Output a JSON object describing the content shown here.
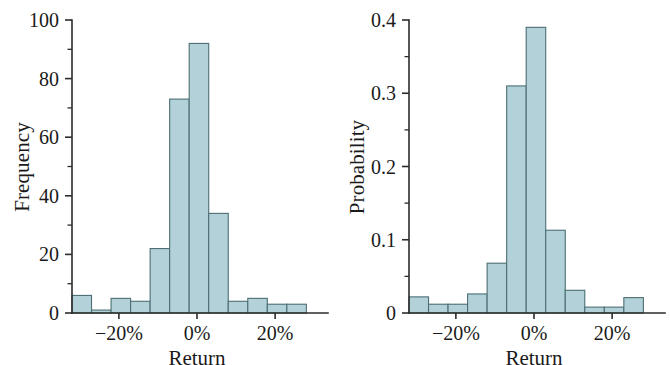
{
  "figure": {
    "background_color": "#ffffff",
    "bar_fill_color": "#b3d1d8",
    "bar_stroke_color": "#4c6e74",
    "axis_color": "#2b2b2b"
  },
  "panels": [
    {
      "id": "frequency-histogram",
      "ylabel": "Frequency",
      "xlabel": "Return",
      "y_ticks": [
        "0",
        "20",
        "40",
        "60",
        "80",
        "100"
      ],
      "x_ticks": [
        "−20%",
        "0%",
        "20%"
      ]
    },
    {
      "id": "probability-histogram",
      "ylabel": "Probability",
      "xlabel": "Return",
      "y_ticks": [
        "0",
        "0.1",
        "0.2",
        "0.3",
        "0.4"
      ],
      "x_ticks": [
        "−20%",
        "0%",
        "20%"
      ]
    }
  ],
  "chart_data": [
    {
      "type": "bar",
      "id": "frequency-histogram",
      "title": "",
      "xlabel": "Return",
      "ylabel": "Frequency",
      "xlim": [
        -0.32,
        0.32
      ],
      "ylim": [
        0,
        100
      ],
      "ytick_values": [
        0,
        20,
        40,
        60,
        80,
        100
      ],
      "ytick_labels": [
        "0",
        "20",
        "40",
        "60",
        "80",
        "100"
      ],
      "yminor_values": [
        10,
        30,
        50,
        70,
        90
      ],
      "xtick_values": [
        -0.2,
        0,
        0.2
      ],
      "xtick_labels": [
        "−20%",
        "0%",
        "20%"
      ],
      "grid": false,
      "legend": "none",
      "bin_edges": [
        -0.32,
        -0.27,
        -0.22,
        -0.17,
        -0.12,
        -0.07,
        -0.02,
        0.03,
        0.08,
        0.13,
        0.18,
        0.23,
        0.28
      ],
      "bin_centers": [
        -0.295,
        -0.245,
        -0.195,
        -0.145,
        -0.095,
        -0.045,
        0.005,
        0.055,
        0.105,
        0.155,
        0.205,
        0.255
      ],
      "categories": [
        "-32% to -27%",
        "-27% to -22%",
        "-22% to -17%",
        "-17% to -12%",
        "-12% to -7%",
        "-7% to -2%",
        "-2% to 3%",
        "3% to 8%",
        "8% to 13%",
        "13% to 18%",
        "18% to 23%",
        "23% to 28%"
      ],
      "values": [
        6,
        1,
        5,
        4,
        22,
        73,
        92,
        34,
        4,
        5,
        3,
        3
      ]
    },
    {
      "type": "bar",
      "id": "probability-histogram",
      "title": "",
      "xlabel": "Return",
      "ylabel": "Probability",
      "xlim": [
        -0.32,
        0.32
      ],
      "ylim": [
        0,
        0.4
      ],
      "ytick_values": [
        0,
        0.1,
        0.2,
        0.3,
        0.4
      ],
      "ytick_labels": [
        "0",
        "0.1",
        "0.2",
        "0.3",
        "0.4"
      ],
      "yminor_values": [
        0.05,
        0.15,
        0.25,
        0.35
      ],
      "xtick_values": [
        -0.2,
        0,
        0.2
      ],
      "xtick_labels": [
        "−20%",
        "0%",
        "20%"
      ],
      "grid": false,
      "legend": "none",
      "bin_edges": [
        -0.32,
        -0.27,
        -0.22,
        -0.17,
        -0.12,
        -0.07,
        -0.02,
        0.03,
        0.08,
        0.13,
        0.18,
        0.23,
        0.28
      ],
      "bin_centers": [
        -0.295,
        -0.245,
        -0.195,
        -0.145,
        -0.095,
        -0.045,
        0.005,
        0.055,
        0.105,
        0.155,
        0.205,
        0.255
      ],
      "categories": [
        "-32% to -27%",
        "-27% to -22%",
        "-22% to -17%",
        "-17% to -12%",
        "-12% to -7%",
        "-7% to -2%",
        "-2% to 3%",
        "3% to 8%",
        "8% to 13%",
        "13% to 18%",
        "18% to 23%",
        "23% to 28%"
      ],
      "values": [
        0.022,
        0.012,
        0.012,
        0.026,
        0.068,
        0.31,
        0.39,
        0.113,
        0.031,
        0.008,
        0.008,
        0.021
      ]
    }
  ]
}
